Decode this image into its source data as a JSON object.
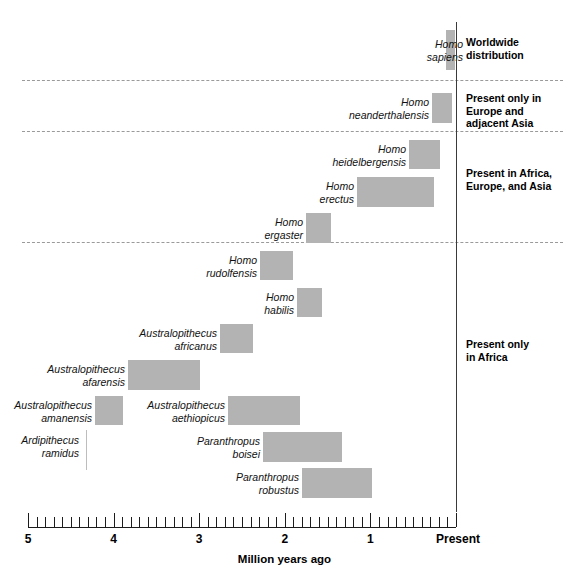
{
  "figure": {
    "axis": {
      "label": "Million years ago",
      "present_label": "Present",
      "ticks": [
        "5",
        "4",
        "3",
        "2",
        "1"
      ],
      "range_max_mya": 5,
      "range_min_mya": 0,
      "minor_tick_step_mya": 0.1
    },
    "colors": {
      "bar": "#b3b3b3",
      "axis": "#1c1c1c",
      "separator": "#9a9a9a",
      "text": "#000000"
    }
  },
  "chart_data": {
    "type": "bar",
    "xlabel": "Million years ago",
    "ylabel": "",
    "xlim": [
      5,
      0
    ],
    "grid": false,
    "orientation": "horizontal-range",
    "note": "Each bar is a time range in millions of years ago (start = older, end = younger).",
    "categories": [
      "Homo sapiens",
      "Homo neanderthalensis",
      "Homo heidelbergensis",
      "Homo erectus",
      "Homo ergaster",
      "Homo rudolfensis",
      "Homo habilis",
      "Australopithecus africanus",
      "Australopithecus afarensis",
      "Australopithecus amanensis",
      "Australopithecus aethiopicus",
      "Ardipithecus ramidus",
      "Paranthropus boisei",
      "Paranthropus robustus"
    ],
    "ranges_mya": [
      [
        0.15,
        0.0
      ],
      [
        0.28,
        0.04
      ],
      [
        0.55,
        0.2
      ],
      [
        1.15,
        0.25
      ],
      [
        1.75,
        1.45
      ],
      [
        2.3,
        1.9
      ],
      [
        1.85,
        1.55
      ],
      [
        2.75,
        2.35
      ],
      [
        3.85,
        3.0
      ],
      [
        4.2,
        3.9
      ],
      [
        2.65,
        1.8
      ],
      [
        4.35,
        4.35
      ],
      [
        2.25,
        1.3
      ],
      [
        1.8,
        0.97
      ]
    ]
  },
  "species": [
    {
      "name": "Homo\nsapiens",
      "group": 0,
      "bar": {
        "x": 446,
        "width": 9,
        "y": 30,
        "height": 40
      },
      "label": {
        "right": 463,
        "top": 38
      },
      "shape": "bar"
    },
    {
      "name": "Homo\nneanderthalensis",
      "group": 1,
      "bar": {
        "x": 432,
        "width": 20,
        "y": 93,
        "height": 30
      },
      "label": {
        "right": 429,
        "top": 96
      },
      "shape": "bar"
    },
    {
      "name": "Homo\nheidelbergensis",
      "group": 2,
      "bar": {
        "x": 409,
        "width": 31,
        "y": 140,
        "height": 29
      },
      "label": {
        "right": 406,
        "top": 143
      },
      "shape": "bar"
    },
    {
      "name": "Homo\nerectus",
      "group": 2,
      "bar": {
        "x": 357,
        "width": 77,
        "y": 177,
        "height": 30
      },
      "label": {
        "right": 354,
        "top": 180
      },
      "shape": "bar"
    },
    {
      "name": "Homo\nergaster",
      "group": 2,
      "bar": {
        "x": 306,
        "width": 25,
        "y": 213,
        "height": 30
      },
      "label": {
        "right": 303,
        "top": 216
      },
      "shape": "bar"
    },
    {
      "name": "Homo\nrudolfensis",
      "group": 3,
      "bar": {
        "x": 260,
        "width": 33,
        "y": 251,
        "height": 29
      },
      "label": {
        "right": 257,
        "top": 254
      },
      "shape": "bar"
    },
    {
      "name": "Homo\nhabilis",
      "group": 3,
      "bar": {
        "x": 297,
        "width": 25,
        "y": 288,
        "height": 29
      },
      "label": {
        "right": 294,
        "top": 291
      },
      "shape": "bar"
    },
    {
      "name": "Australopithecus\nafricanus",
      "group": 3,
      "bar": {
        "x": 220,
        "width": 33,
        "y": 324,
        "height": 29
      },
      "label": {
        "right": 217,
        "top": 327
      },
      "shape": "bar"
    },
    {
      "name": "Australopithecus\nafarensis",
      "group": 3,
      "bar": {
        "x": 128,
        "width": 72,
        "y": 360,
        "height": 30
      },
      "label": {
        "right": 125,
        "top": 363
      },
      "shape": "bar"
    },
    {
      "name": "Australopithecus\namanensis",
      "group": 3,
      "bar": {
        "x": 95,
        "width": 28,
        "y": 396,
        "height": 29
      },
      "label": {
        "right": 92,
        "top": 399
      },
      "shape": "bar"
    },
    {
      "name": "Australopithecus\naethiopicus",
      "group": 3,
      "bar": {
        "x": 228,
        "width": 72,
        "y": 396,
        "height": 29
      },
      "label": {
        "right": 225,
        "top": 399
      },
      "shape": "bar"
    },
    {
      "name": "Ardipithecus\nramidus",
      "group": 3,
      "bar": {
        "x": 86,
        "width": 1,
        "y": 430,
        "height": 40
      },
      "label": {
        "right": 79,
        "top": 434
      },
      "shape": "hairline"
    },
    {
      "name": "Paranthropus\nboisei",
      "group": 3,
      "bar": {
        "x": 263,
        "width": 79,
        "y": 432,
        "height": 30
      },
      "label": {
        "right": 260,
        "top": 435
      },
      "shape": "bar"
    },
    {
      "name": "Paranthropus\nrobustus",
      "group": 3,
      "bar": {
        "x": 302,
        "width": 70,
        "y": 468,
        "height": 30
      },
      "label": {
        "right": 299,
        "top": 471
      },
      "shape": "bar"
    }
  ],
  "distributions": [
    {
      "text": "Worldwide\ndistribution",
      "top": 36
    },
    {
      "text": "Present only in\nEurope and\nadjacent Asia",
      "top": 92
    },
    {
      "text": "Present in Africa,\nEurope, and Asia",
      "top": 167
    },
    {
      "text": "Present only\nin Africa",
      "top": 338
    }
  ],
  "separators": [
    {
      "top": 80
    },
    {
      "top": 131
    },
    {
      "top": 242
    }
  ],
  "present_line": {
    "x": 456,
    "top": 22,
    "bottom": 512
  }
}
